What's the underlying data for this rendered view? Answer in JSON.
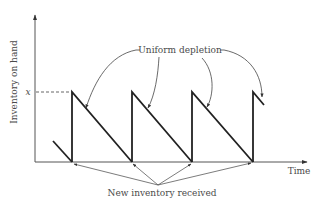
{
  "diagram": {
    "type": "sawtooth inventory model",
    "axes": {
      "y_label": "Inventory on hand",
      "x_label": "Time",
      "level_label": "x"
    },
    "annotations": {
      "depletion_label": "Uniform depletion",
      "receipt_label": "New inventory received"
    },
    "cycles": 3,
    "colors": {
      "ink": "#222222",
      "text": "#4a4a4a",
      "background": "#ffffff"
    }
  }
}
